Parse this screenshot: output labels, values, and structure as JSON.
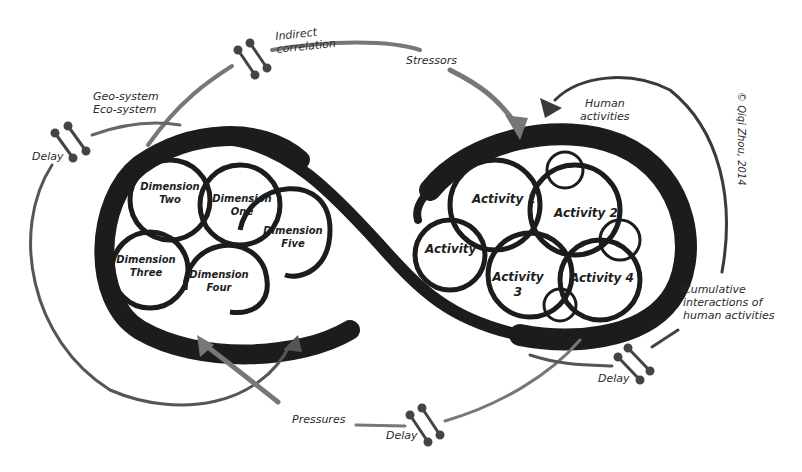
{
  "diagram": {
    "type": "figure-eight feedback loop",
    "copyright": "© Qiqi Zhou, 2014",
    "left_loop": {
      "system_label": [
        "Geo-system",
        "Eco-system"
      ],
      "nodes": [
        {
          "id": "dim-two",
          "line1": "Dimension",
          "line2": "Two"
        },
        {
          "id": "dim-one",
          "line1": "Dimension",
          "line2": "One"
        },
        {
          "id": "dim-five",
          "line1": "Dimension",
          "line2": "Five"
        },
        {
          "id": "dim-three",
          "line1": "Dimension",
          "line2": "Three"
        },
        {
          "id": "dim-four",
          "line1": "Dimension",
          "line2": "Four"
        }
      ]
    },
    "right_loop": {
      "system_label": [
        "Human",
        "activities"
      ],
      "nodes": [
        {
          "id": "act-1",
          "line1": "Activity 1",
          "line2": ""
        },
        {
          "id": "act-2",
          "line1": "Activity 2",
          "line2": ""
        },
        {
          "id": "act",
          "line1": "Activity",
          "line2": ""
        },
        {
          "id": "act-3",
          "line1": "Activity",
          "line2": "3"
        },
        {
          "id": "act-4",
          "line1": "Activity 4",
          "line2": ""
        }
      ]
    },
    "edges": {
      "indirect_correlation": [
        "Indirect",
        "correlation"
      ],
      "stressors": "Stressors",
      "pressures": "Pressures",
      "cumulative": [
        "Cumulative",
        "interactions of",
        "human activities"
      ],
      "delay_labels": [
        "Delay",
        "Delay",
        "Delay"
      ]
    },
    "colors": {
      "ink": "#1c1c1c",
      "arrow_gray": "#6e6e6e",
      "arrow_dark": "#3a3a3a",
      "background": "#ffffff"
    }
  }
}
